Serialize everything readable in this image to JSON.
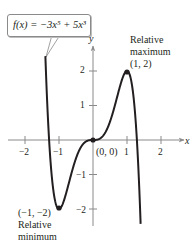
{
  "chart_data": {
    "type": "line",
    "title": "",
    "function_label": "f(x) = −3x⁵ + 5x³",
    "function": {
      "name": "f",
      "expression": "-3x^5 + 5x^3"
    },
    "xlabel": "x",
    "ylabel": "y",
    "xlim": [
      -2.5,
      2.7
    ],
    "ylim": [
      -2.5,
      2.7
    ],
    "x_ticks": [
      -2,
      -1,
      1,
      2
    ],
    "x_tick_labels": [
      "−2",
      "−1",
      "1",
      "2"
    ],
    "y_ticks": [
      -2,
      -1,
      1,
      2
    ],
    "y_tick_labels": [
      "−2",
      "−1",
      "1",
      "2"
    ],
    "grid": false,
    "series": [
      {
        "name": "f(x) = −3x⁵ + 5x³",
        "x": [
          -1.4,
          -1.2,
          -1.0,
          -0.8,
          -0.6,
          -0.4,
          -0.2,
          0,
          0.2,
          0.4,
          0.6,
          0.8,
          1.0,
          1.2,
          1.4
        ],
        "y": [
          2.42,
          -1.1,
          -2.0,
          -1.58,
          -0.85,
          -0.29,
          -0.04,
          0,
          0.04,
          0.29,
          0.85,
          1.58,
          2.0,
          1.1,
          -2.42
        ]
      }
    ],
    "points": [
      {
        "x": -1,
        "y": -2,
        "label": "(−1, −2)",
        "note": "Relative minimum"
      },
      {
        "x": 0,
        "y": 0,
        "label": "(0, 0)",
        "note": ""
      },
      {
        "x": 1,
        "y": 2,
        "label": "(1, 2)",
        "note": "Relative maximum"
      }
    ]
  },
  "labels": {
    "callout": "f(x) = −3x⁵ + 5x³",
    "axis_x": "x",
    "axis_y": "y",
    "origin": "(0, 0)",
    "max_line1": "Relative",
    "max_line2": "maximum",
    "max_coord": "(1, 2)",
    "min_coord": "(−1, −2)",
    "min_line1": "Relative",
    "min_line2": "minimum",
    "xt_m2": "−2",
    "xt_m1": "−1",
    "xt_1": "1",
    "xt_2": "2",
    "yt_2": "2",
    "yt_1": "1",
    "yt_m1": "−1",
    "yt_m2": "−2"
  },
  "colors": {
    "curve": "#231f20",
    "axis": "#8a8a8a",
    "text": "#231f20"
  }
}
